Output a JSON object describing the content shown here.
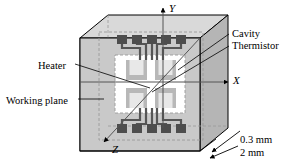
{
  "figure": {
    "type": "isometric-3d-diagram"
  },
  "axes": {
    "x": {
      "label": "X",
      "direction": "right"
    },
    "y": {
      "label": "Y",
      "direction": "up"
    },
    "z": {
      "label": "Z",
      "direction": "down-left"
    }
  },
  "callouts": [
    {
      "id": "heater",
      "label": "Heater",
      "side": "left"
    },
    {
      "id": "working-plane",
      "label": "Working plane",
      "side": "left"
    },
    {
      "id": "cavity",
      "label": "Cavity",
      "side": "right"
    },
    {
      "id": "thermistor",
      "label": "Thermistor",
      "side": "right"
    }
  ],
  "dimensions": [
    {
      "id": "thickness",
      "label": "0.3 mm"
    },
    {
      "id": "depth",
      "label": "2 mm"
    }
  ],
  "structure": {
    "pads_top_count": 5,
    "pads_bottom_count": 5,
    "thermistor_count": 4,
    "cavity_fill": "#ffffff",
    "chip_face_fill": "#c9c9c9",
    "chip_top_fill": "#d8d8d8",
    "chip_side_fill": "#b3b3b3",
    "pad_fill": "#4d4d4d",
    "trace_color": "#555555",
    "outline_color": "#000000",
    "dash_color": "#9a9a9a"
  }
}
